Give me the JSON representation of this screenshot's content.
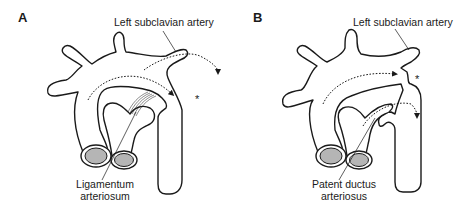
{
  "figure": {
    "panels": [
      {
        "id": "A",
        "letter": "A",
        "top_label": "Left subclavian artery",
        "bottom_label_line1": "Ligamentum",
        "bottom_label_line2": "arteriosum",
        "marker": "*"
      },
      {
        "id": "B",
        "letter": "B",
        "top_label": "Left subclavian artery",
        "bottom_label_line1": "Patent ductus",
        "bottom_label_line2": "arteriosus",
        "marker": "*"
      }
    ],
    "colors": {
      "outline": "#1a1a1a",
      "lumen_fill": "#b5b5b5",
      "background": "#ffffff"
    }
  }
}
